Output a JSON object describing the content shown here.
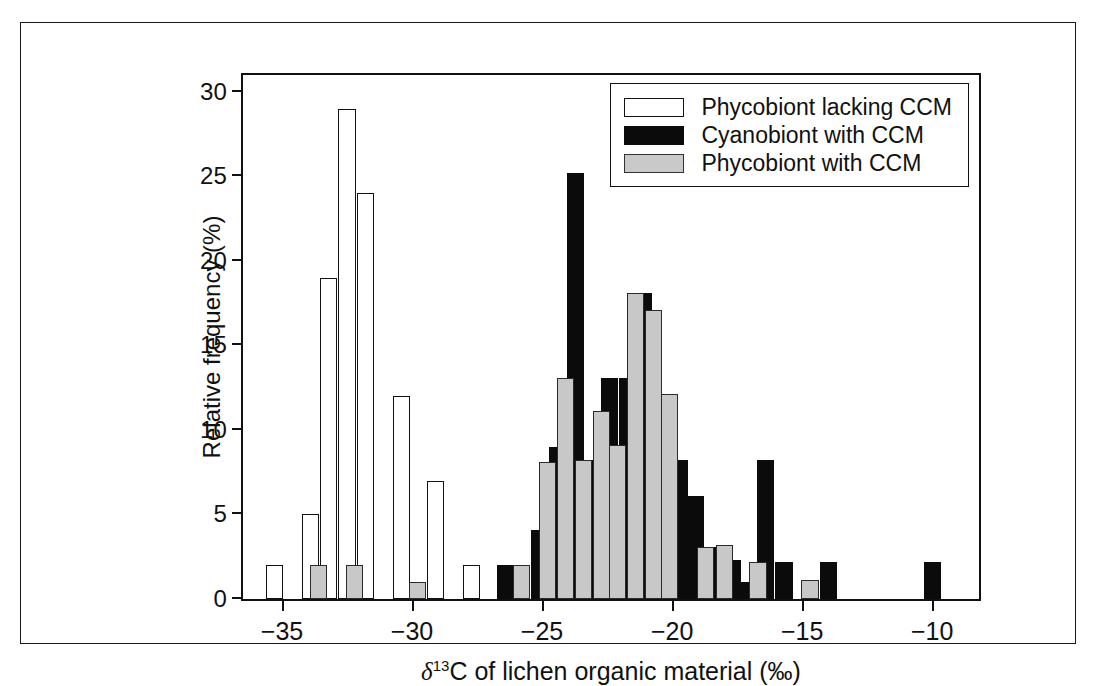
{
  "chart_data": {
    "type": "bar",
    "title": "",
    "xlabel": "δ 13C of lichen organic material (‰)",
    "ylabel": "Relative frequency (%)",
    "xlim": [
      -36.5,
      -8.2
    ],
    "ylim": [
      0,
      31
    ],
    "xticks": [
      -35,
      -30,
      -25,
      -20,
      -15,
      -10
    ],
    "xticklabels": [
      "−35",
      "−30",
      "−25",
      "−20",
      "−15",
      "−10"
    ],
    "yticks": [
      0,
      5,
      10,
      15,
      20,
      25,
      30
    ],
    "yticklabels": [
      "0",
      "5",
      "10",
      "15",
      "20",
      "25",
      "30"
    ],
    "grid": false,
    "bin_width": 0.66,
    "legend_position": "top-right",
    "series": [
      {
        "name": "Phycobiont lacking CCM",
        "key": "white",
        "color": "#ffffff",
        "edge": "#111111",
        "points": [
          {
            "x": -35.3,
            "y": 2.0
          },
          {
            "x": -33.9,
            "y": 5.0
          },
          {
            "x": -33.2,
            "y": 19.0
          },
          {
            "x": -32.5,
            "y": 29.0
          },
          {
            "x": -31.8,
            "y": 24.0
          },
          {
            "x": -30.4,
            "y": 12.0
          },
          {
            "x": -29.1,
            "y": 7.0
          },
          {
            "x": -27.7,
            "y": 2.0
          }
        ]
      },
      {
        "name": "Cyanobiont with CCM",
        "key": "black",
        "color": "#0b0b0b",
        "edge": "#0b0b0b",
        "points": [
          {
            "x": -26.4,
            "y": 2.0
          },
          {
            "x": -25.1,
            "y": 4.1
          },
          {
            "x": -24.4,
            "y": 9.0
          },
          {
            "x": -23.7,
            "y": 25.2
          },
          {
            "x": -23.1,
            "y": 8.2
          },
          {
            "x": -22.4,
            "y": 13.1
          },
          {
            "x": -21.7,
            "y": 13.1
          },
          {
            "x": -21.1,
            "y": 18.1
          },
          {
            "x": -20.4,
            "y": 8.2
          },
          {
            "x": -19.7,
            "y": 8.2
          },
          {
            "x": -19.1,
            "y": 6.1
          },
          {
            "x": -18.4,
            "y": 3.1
          },
          {
            "x": -17.7,
            "y": 2.3
          },
          {
            "x": -17.1,
            "y": 1.0
          },
          {
            "x": -16.4,
            "y": 8.2
          },
          {
            "x": -15.7,
            "y": 2.2
          },
          {
            "x": -14.0,
            "y": 2.2
          },
          {
            "x": -10.0,
            "y": 2.2
          }
        ]
      },
      {
        "name": "Phycobiont with CCM",
        "key": "gray",
        "color": "#c8c8c8",
        "edge": "#2a2a2a",
        "points": [
          {
            "x": -33.6,
            "y": 2.0
          },
          {
            "x": -32.2,
            "y": 2.0
          },
          {
            "x": -29.8,
            "y": 1.0
          },
          {
            "x": -25.8,
            "y": 2.0
          },
          {
            "x": -24.8,
            "y": 8.1
          },
          {
            "x": -24.1,
            "y": 13.1
          },
          {
            "x": -23.4,
            "y": 8.2
          },
          {
            "x": -22.7,
            "y": 11.1
          },
          {
            "x": -22.1,
            "y": 9.1
          },
          {
            "x": -21.4,
            "y": 18.1
          },
          {
            "x": -20.7,
            "y": 17.1
          },
          {
            "x": -20.1,
            "y": 12.1
          },
          {
            "x": -18.7,
            "y": 3.1
          },
          {
            "x": -18.0,
            "y": 3.2
          },
          {
            "x": -16.7,
            "y": 2.2
          },
          {
            "x": -14.7,
            "y": 1.1
          }
        ]
      }
    ]
  },
  "legend": {
    "items": [
      {
        "label": "Phycobiont lacking CCM",
        "key": "white"
      },
      {
        "label": "Cyanobiont with CCM",
        "key": "black"
      },
      {
        "label": "Phycobiont with CCM",
        "key": "gray"
      }
    ]
  },
  "axis_title_x_parts": {
    "symbol": "δ",
    "sup": "13",
    "rest": "C of lichen organic material (‰)"
  }
}
